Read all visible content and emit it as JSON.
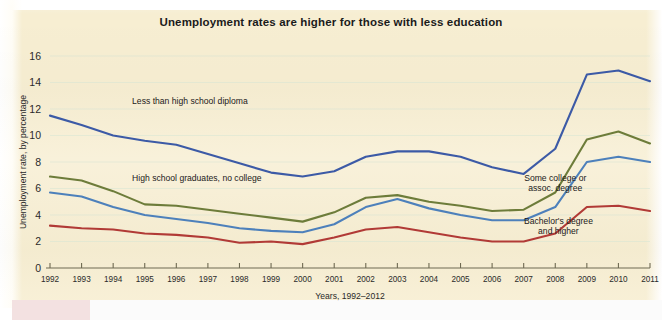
{
  "figure": {
    "title": "Unemployment rates are higher for those with less education",
    "background_color": "#f7eed2"
  },
  "chart_data": {
    "type": "line",
    "title": "Unemployment rates are higher for those with less education",
    "xlabel": "Years, 1992–2012",
    "ylabel": "Unemployment rate, by percentage",
    "categories": [
      "1992",
      "1993",
      "1994",
      "1995",
      "1996",
      "1997",
      "1998",
      "1999",
      "2000",
      "2001",
      "2002",
      "2003",
      "2004",
      "2005",
      "2006",
      "2007",
      "2008",
      "2009",
      "2010",
      "2011"
    ],
    "x": [
      1992,
      1993,
      1994,
      1995,
      1996,
      1997,
      1998,
      1999,
      2000,
      2001,
      2002,
      2003,
      2004,
      2005,
      2006,
      2007,
      2008,
      2009,
      2010,
      2011
    ],
    "ylim": [
      0,
      16
    ],
    "xlim": [
      1992,
      2011
    ],
    "yticks": [
      0,
      2,
      4,
      6,
      8,
      10,
      12,
      14,
      16
    ],
    "grid": true,
    "legend": "inline-annotations",
    "series": [
      {
        "name": "Less than high school diploma",
        "color": "#3c5aa6",
        "label_x": 1994.6,
        "label_y": 12.4,
        "values": [
          11.5,
          10.8,
          10.0,
          9.6,
          9.3,
          8.6,
          7.9,
          7.2,
          6.9,
          7.3,
          8.4,
          8.8,
          8.8,
          8.4,
          7.6,
          7.1,
          9.0,
          14.6,
          14.9,
          14.1
        ]
      },
      {
        "name": "High school graduates, no college",
        "color": "#6d7c3a",
        "label_x": 1994.6,
        "label_y": 6.6,
        "values": [
          6.9,
          6.6,
          5.8,
          4.8,
          4.7,
          4.4,
          4.1,
          3.8,
          3.5,
          4.2,
          5.3,
          5.5,
          5.0,
          4.7,
          4.3,
          4.4,
          5.7,
          9.7,
          10.3,
          9.4
        ]
      },
      {
        "name": "Some college or assoc. degree",
        "color": "#4d80bb",
        "label_x": 2008.0,
        "label_y": 6.6,
        "values": [
          5.7,
          5.4,
          4.6,
          4.0,
          3.7,
          3.4,
          3.0,
          2.8,
          2.7,
          3.3,
          4.6,
          5.2,
          4.5,
          4.0,
          3.6,
          3.6,
          4.6,
          8.0,
          8.4,
          8.0
        ]
      },
      {
        "name": "Bachelor's degree and higher",
        "color": "#b13a36",
        "label_x": 2008.1,
        "label_y": 3.3,
        "values": [
          3.2,
          3.0,
          2.9,
          2.6,
          2.5,
          2.3,
          1.9,
          2.0,
          1.8,
          2.3,
          2.9,
          3.1,
          2.7,
          2.3,
          2.0,
          2.0,
          2.6,
          4.6,
          4.7,
          4.3
        ]
      }
    ],
    "annotations": [
      {
        "text": "Less than high school diploma",
        "series": 0
      },
      {
        "text": "High school graduates, no college",
        "series": 1
      },
      {
        "text": "Some college or",
        "series": 2,
        "line": 1
      },
      {
        "text": "assoc. degree",
        "series": 2,
        "line": 2
      },
      {
        "text": "Bachelor's degree",
        "series": 3,
        "line": 1
      },
      {
        "text": "and higher",
        "series": 3,
        "line": 2
      }
    ]
  }
}
